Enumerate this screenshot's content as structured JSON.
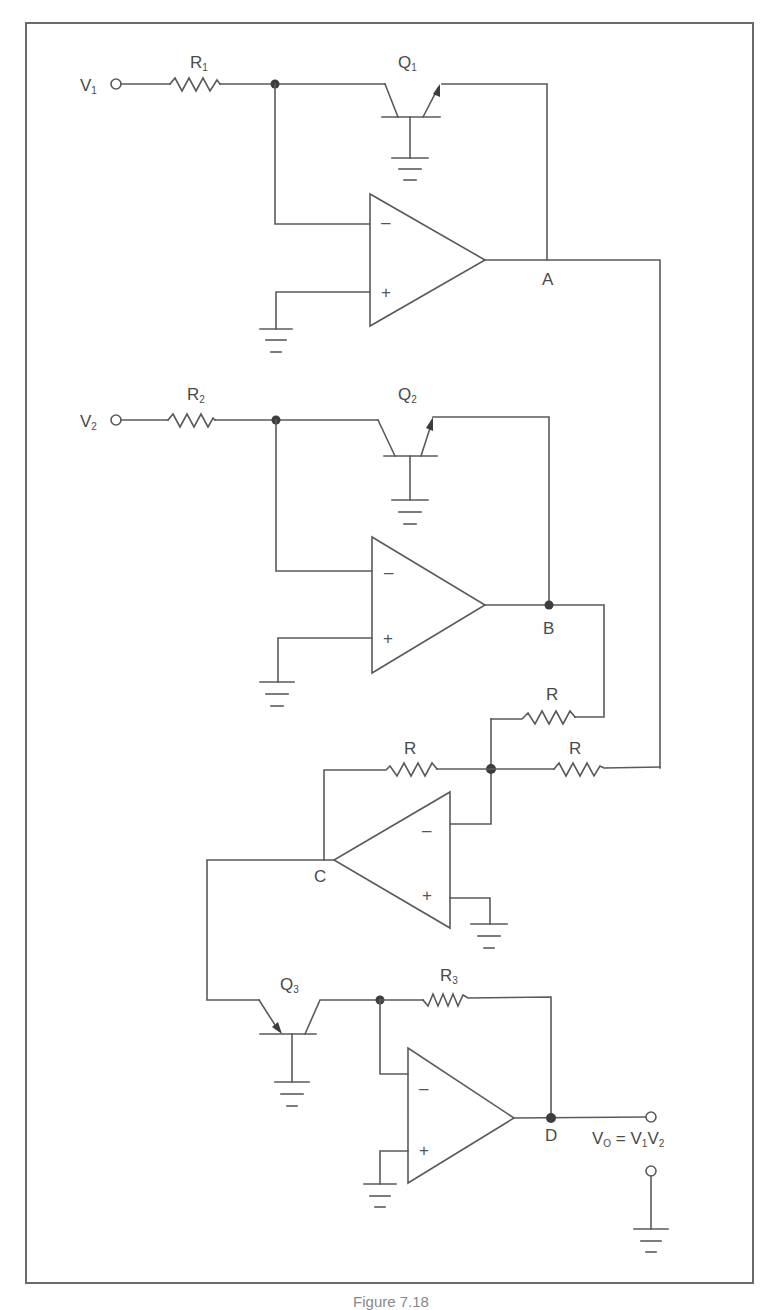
{
  "figure": {
    "caption": "Figure 7.18",
    "colors": {
      "line": "#5a5a5a",
      "junction": "#3d3d3d",
      "frame": "#6a6a6a",
      "background": "#ffffff"
    }
  },
  "inputs": {
    "v1": {
      "main": "V",
      "sub": "1"
    },
    "v2": {
      "main": "V",
      "sub": "2"
    }
  },
  "resistors": {
    "r1": {
      "main": "R",
      "sub": "1"
    },
    "r2": {
      "main": "R",
      "sub": "2"
    },
    "r3": {
      "main": "R",
      "sub": "3"
    },
    "r_top": {
      "main": "R"
    },
    "r_left": {
      "main": "R"
    },
    "r_right": {
      "main": "R"
    }
  },
  "transistors": {
    "q1": {
      "main": "Q",
      "sub": "1"
    },
    "q2": {
      "main": "Q",
      "sub": "2"
    },
    "q3": {
      "main": "Q",
      "sub": "3"
    }
  },
  "nodes": {
    "a": "A",
    "b": "B",
    "c": "C",
    "d": "D"
  },
  "opamp_signs": {
    "minus": "–",
    "plus": "+"
  },
  "output": {
    "vo_main": "V",
    "vo_sub": "O",
    "equals": " = ",
    "rhs_v1": "V",
    "rhs_v1_sub": "1",
    "rhs_v2": "V",
    "rhs_v2_sub": "2"
  }
}
